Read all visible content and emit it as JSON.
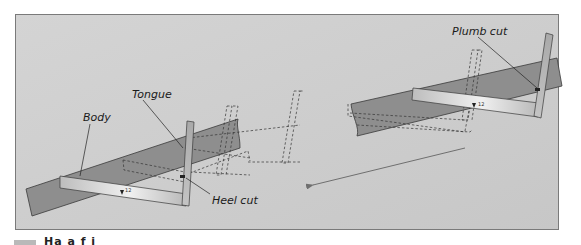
{
  "figure": {
    "labels": {
      "body": "Body",
      "tongue": "Tongue",
      "heel_cut": "Heel cut",
      "plumb_cut": "Plumb cut"
    },
    "square_ticks": {
      "left": "12",
      "right": "12"
    },
    "colors": {
      "background_panel": "#cfcfcf",
      "board": "#8e8e8e",
      "square_light": "#e8e8e8",
      "square_dark": "#b6b6b6",
      "outline": "#3a3a3a",
      "arrow": "#6f6f6f"
    }
  },
  "caption": {
    "text": "Ha  a  f  i"
  }
}
